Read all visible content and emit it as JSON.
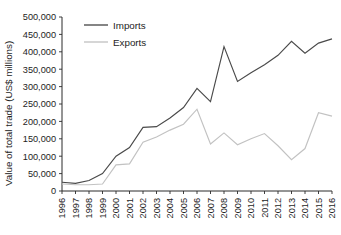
{
  "chart_data": {
    "type": "line",
    "title": "",
    "subtitle": "",
    "xlabel": "",
    "ylabel": "Value of total trade (US$ millions)",
    "categories": [
      "1996",
      "1997",
      "1998",
      "1999",
      "2000",
      "2001",
      "2002",
      "2003",
      "2004",
      "2005",
      "2006",
      "2007",
      "2008",
      "2009",
      "2010",
      "2011",
      "2012",
      "2013",
      "2014",
      "2015",
      "2016"
    ],
    "x": [
      1996,
      1997,
      1998,
      1999,
      2000,
      2001,
      2002,
      2003,
      2004,
      2005,
      2006,
      2007,
      2008,
      2009,
      2010,
      2011,
      2012,
      2013,
      2014,
      2015,
      2016
    ],
    "series": [
      {
        "name": "Imports",
        "color": "#4a4a4a",
        "values": [
          25000,
          22000,
          30000,
          50000,
          100000,
          125000,
          183000,
          185000,
          210000,
          240000,
          295000,
          257000,
          415000,
          315000,
          340000,
          363000,
          390000,
          430000,
          396000,
          425000,
          437000
        ]
      },
      {
        "name": "Exports",
        "color": "#c2c2c2",
        "values": [
          20000,
          18000,
          18000,
          20000,
          75000,
          78000,
          140000,
          155000,
          175000,
          192000,
          235000,
          135000,
          167000,
          133000,
          150000,
          165000,
          130000,
          90000,
          122000,
          225000,
          215000
        ]
      }
    ],
    "ylim": [
      0,
      500000
    ],
    "ytick_step": 50000,
    "ytick_labels": [
      "0",
      "50,000",
      "100,000",
      "150,000",
      "200,000",
      "250,000",
      "300,000",
      "350,000",
      "400,000",
      "450,000",
      "500,000"
    ],
    "grid": false,
    "legend_position": "top-left",
    "legend_entries": [
      "Imports",
      "Exports"
    ]
  },
  "axis": {
    "y_title": "Value of total trade (US$ millions)"
  },
  "legend": {
    "imports_label": "Imports",
    "exports_label": "Exports"
  }
}
